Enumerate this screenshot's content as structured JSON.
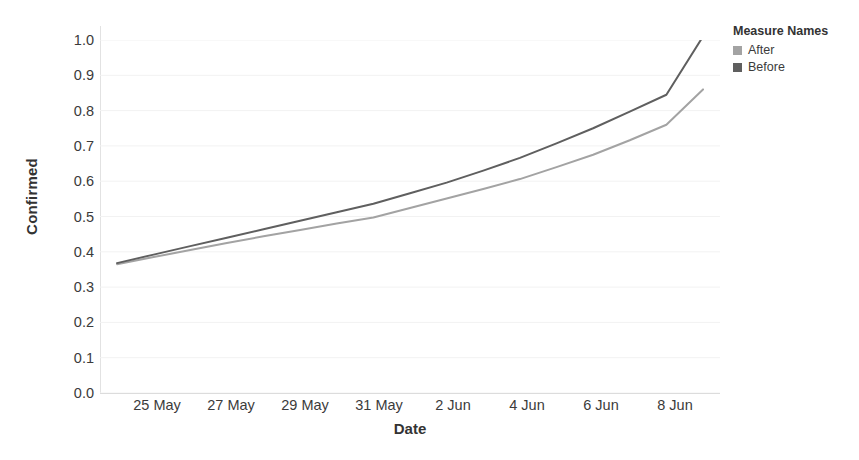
{
  "chart_data": {
    "type": "line",
    "title": "",
    "xlabel": "Date",
    "ylabel": "Confirmed",
    "grid": true,
    "legend_position": "right",
    "legend_title": "Measure Names",
    "x": [
      "24 May",
      "25 May",
      "26 May",
      "27 May",
      "28 May",
      "29 May",
      "30 May",
      "31 May",
      "1 Jun",
      "2 Jun",
      "3 Jun",
      "4 Jun",
      "5 Jun",
      "6 Jun",
      "7 Jun",
      "8 Jun",
      "9 Jun"
    ],
    "xtick_labels": [
      "25 May",
      "27 May",
      "29 May",
      "31 May",
      "2 Jun",
      "4 Jun",
      "6 Jun",
      "8 Jun"
    ],
    "ytick_labels": [
      "0.0",
      "0.1",
      "0.2",
      "0.3",
      "0.4",
      "0.5",
      "0.6",
      "0.7",
      "0.8",
      "0.9",
      "1.0"
    ],
    "ylim": [
      0.0,
      1.0
    ],
    "series": [
      {
        "name": "After",
        "color": "#a3a3a3",
        "values": [
          0.365,
          0.385,
          0.405,
          0.425,
          0.444,
          0.462,
          0.48,
          0.497,
          0.524,
          0.551,
          0.578,
          0.606,
          0.64,
          0.675,
          0.716,
          0.76,
          0.86
        ]
      },
      {
        "name": "Before",
        "color": "#5f5f5f",
        "values": [
          0.368,
          0.392,
          0.416,
          0.44,
          0.464,
          0.488,
          0.512,
          0.536,
          0.566,
          0.596,
          0.63,
          0.666,
          0.707,
          0.75,
          0.797,
          0.845,
          1.01
        ]
      }
    ]
  },
  "axis": {
    "y_title": "Confirmed",
    "x_title": "Date"
  },
  "legend": {
    "title": "Measure Names",
    "items": [
      {
        "label": "After",
        "color": "#a3a3a3"
      },
      {
        "label": "Before",
        "color": "#5f5f5f"
      }
    ]
  },
  "colors": {
    "gridline": "#f2f2f2",
    "axis": "#dcdcdc",
    "text": "#3b3b3b",
    "title_text": "#333333",
    "background": "#ffffff"
  }
}
